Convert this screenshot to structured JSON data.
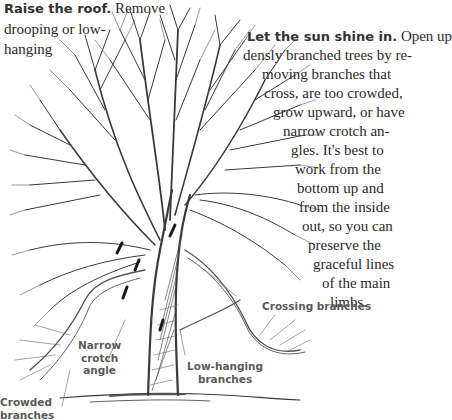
{
  "captions": {
    "raise_roof": {
      "lead": "Raise the roof.",
      "lines": [
        "Remove",
        "drooping or low-",
        "hanging"
      ]
    },
    "sun_shine": {
      "lead": "Let the sun shine in.",
      "lines": [
        "Open up",
        "densly branched trees by re-",
        "moving branches that",
        "cross, are too crowded,",
        "grow upward, or have",
        "narrow crotch an-",
        "gles. It's best to",
        "work from the",
        "bottom up and",
        "from the inside",
        "out, so you can",
        "preserve the",
        "graceful lines",
        "of the main",
        "limbs."
      ]
    }
  },
  "labels": {
    "crossing": "Crossing branches",
    "narrow_crotch": [
      "Narrow",
      "crotch",
      "angle"
    ],
    "low_hanging": [
      "Low-hanging",
      "branches"
    ],
    "crowded": [
      "Crowded",
      "branches"
    ]
  },
  "illustration": {
    "subject": "bare deciduous tree with pruning cut marks",
    "line_color": "#3a3a3a"
  }
}
